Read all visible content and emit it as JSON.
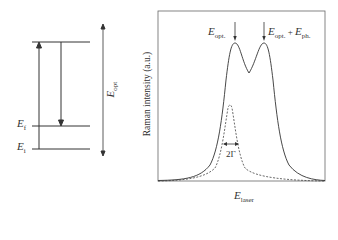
{
  "energy_diagram": {
    "levels": [
      {
        "id": "upper",
        "label": ""
      },
      {
        "id": "final",
        "label_main": "E",
        "label_sub": "f"
      },
      {
        "id": "initial",
        "label_main": "E",
        "label_sub": "i"
      }
    ],
    "span_label_main": "E",
    "span_label_sub": "opt"
  },
  "raman_plot": {
    "ylabel": "Raman intensity (a.u.)",
    "xlabel_main": "E",
    "xlabel_sub": "laser",
    "peak1_main": "E",
    "peak1_sub": "opt.",
    "peak2_main": "E",
    "peak2_sub": "opt.",
    "peak2_plus": " + ",
    "peak2_main2": "E",
    "peak2_sub2": "ph.",
    "width_label": "2Γ"
  },
  "colors": {
    "line": "#333333",
    "frame": "#555555"
  }
}
